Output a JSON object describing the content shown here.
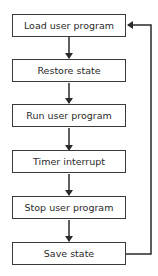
{
  "diagram": {
    "type": "flowchart",
    "direction": "top-to-bottom",
    "steps": [
      {
        "label": "Load user program"
      },
      {
        "label": "Restore state"
      },
      {
        "label": "Run user program"
      },
      {
        "label": "Timer interrupt"
      },
      {
        "label": "Stop user program"
      },
      {
        "label": "Save state"
      }
    ],
    "edges": [
      {
        "from": "Load user program",
        "to": "Restore state"
      },
      {
        "from": "Restore state",
        "to": "Run user program"
      },
      {
        "from": "Run user program",
        "to": "Timer interrupt"
      },
      {
        "from": "Timer interrupt",
        "to": "Stop user program"
      },
      {
        "from": "Stop user program",
        "to": "Save state"
      },
      {
        "from": "Save state",
        "to": "Load user program",
        "kind": "loop-back"
      }
    ],
    "colors": {
      "stroke": "#3a3a3a",
      "text": "#2a2a2a",
      "background": "#ffffff"
    }
  }
}
